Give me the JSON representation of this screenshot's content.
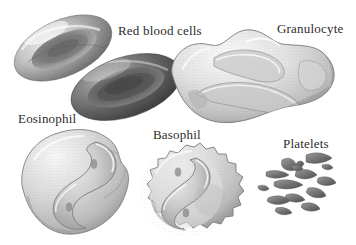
{
  "figure": {
    "background_color": "#ffffff",
    "ink_color": "#2b2b2b",
    "style": "grayscale stipple-engraving scientific illustration"
  },
  "labels": [
    {
      "id": "red-blood-cells",
      "text": "Red blood cells",
      "x": 118,
      "y": 24
    },
    {
      "id": "granulocyte",
      "text": "Granulocyte",
      "x": 277,
      "y": 22
    },
    {
      "id": "eosinophil",
      "text": "Eosinophil",
      "x": 18,
      "y": 112
    },
    {
      "id": "basophil",
      "text": "Basophil",
      "x": 153,
      "y": 128
    },
    {
      "id": "platelets",
      "text": "Platelets",
      "x": 283,
      "y": 137
    }
  ],
  "specimens": [
    {
      "id": "red-blood-cell-upper",
      "name": "Red blood cell (biconcave disc, oblique view)",
      "group": "Red blood cells",
      "shade": "mid gray with concentric rings and dark central pit"
    },
    {
      "id": "red-blood-cell-lower",
      "name": "Red blood cell (biconcave disc, near edge-on)",
      "group": "Red blood cells",
      "shade": "dark gray ellipse with banded shading"
    },
    {
      "id": "granulocyte-cell",
      "name": "Granulocyte (lobed amoeboid leukocyte)",
      "group": "Granulocyte",
      "shade": "pale gray stippled cytoplasm with deep folds"
    },
    {
      "id": "eosinophil-cell",
      "name": "Eosinophil (bilobed S-shaped nucleus)",
      "group": "Eosinophil",
      "shade": "light gray round cell, curved nucleus"
    },
    {
      "id": "basophil-cell",
      "name": "Basophil (spiky margin, S-curved nucleus)",
      "group": "Basophil",
      "shade": "light gray round cell with crenated edge"
    },
    {
      "id": "platelet-cluster",
      "name": "Platelets (scattered irregular fragments)",
      "group": "Platelets",
      "count": 14,
      "shade": "small dark gray angular fragments"
    }
  ]
}
